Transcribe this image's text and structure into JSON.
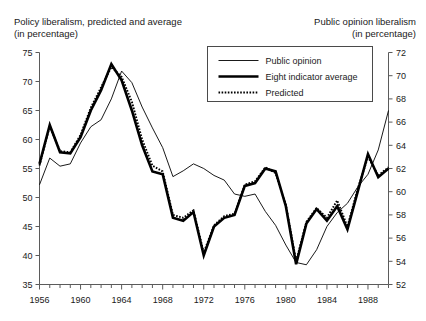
{
  "titles": {
    "left": "Policy liberalism, predicted and average\n(in percentage)",
    "right": "Public opinion liberalism\n(in percentage)"
  },
  "legend": {
    "items": [
      {
        "label": "Public opinion",
        "style": "thin-solid"
      },
      {
        "label": "Eight indicator average",
        "style": "thick-solid"
      },
      {
        "label": "Predicted",
        "style": "dotted"
      }
    ]
  },
  "chart_data": {
    "type": "line",
    "title": "",
    "xlabel": "",
    "ylabel": "Policy liberalism, predicted and average (in percentage)",
    "y2label": "Public opinion liberalism (in percentage)",
    "xlim": [
      1956,
      1990
    ],
    "ylim": [
      35,
      75
    ],
    "y2lim": [
      52,
      72
    ],
    "grid": false,
    "legend_position": "top-center",
    "x_tick_labels": [
      "1956",
      "1960",
      "1964",
      "1968",
      "1972",
      "1976",
      "1980",
      "1984",
      "1988"
    ],
    "x_tick_values": [
      1956,
      1960,
      1964,
      1968,
      1972,
      1976,
      1980,
      1984,
      1988
    ],
    "x_minor_tick_interval": 1,
    "y_tick_labels": [
      "35",
      "40",
      "45",
      "50",
      "55",
      "60",
      "65",
      "70",
      "75"
    ],
    "y_tick_values": [
      35,
      40,
      45,
      50,
      55,
      60,
      65,
      70,
      75
    ],
    "y2_tick_labels": [
      "52",
      "54",
      "56",
      "58",
      "60",
      "62",
      "64",
      "66",
      "68",
      "70",
      "72"
    ],
    "y2_tick_values": [
      52,
      54,
      56,
      58,
      60,
      62,
      64,
      66,
      68,
      70,
      72
    ],
    "x": [
      1956,
      1957,
      1958,
      1959,
      1960,
      1961,
      1962,
      1963,
      1964,
      1965,
      1966,
      1967,
      1968,
      1969,
      1970,
      1971,
      1972,
      1973,
      1974,
      1975,
      1976,
      1977,
      1978,
      1979,
      1980,
      1981,
      1982,
      1983,
      1984,
      1985,
      1986,
      1987,
      1988,
      1989,
      1990
    ],
    "series": [
      {
        "name": "Public opinion",
        "axis": "right",
        "unit": "percent",
        "values": [
          60.6,
          62.9,
          62.2,
          62.4,
          64.2,
          65.6,
          66.2,
          68.0,
          70.4,
          69.4,
          67.3,
          65.5,
          63.8,
          61.3,
          61.8,
          62.4,
          62.0,
          61.4,
          61.0,
          59.8,
          59.6,
          59.8,
          58.3,
          57.1,
          55.4,
          53.9,
          53.7,
          55.0,
          57.0,
          58.2,
          59.0,
          60.4,
          61.5,
          63.6,
          67.0
        ]
      },
      {
        "name": "Eight indicator average",
        "axis": "left",
        "unit": "percent",
        "values": [
          55.8,
          62.5,
          57.8,
          57.6,
          60.4,
          65.0,
          68.5,
          73.0,
          70.2,
          65.0,
          59.0,
          54.5,
          54.0,
          46.5,
          46.0,
          47.5,
          40.0,
          45.0,
          46.5,
          47.0,
          52.0,
          52.5,
          55.0,
          54.5,
          48.5,
          38.5,
          45.5,
          48.0,
          46.0,
          48.5,
          44.5,
          51.0,
          57.5,
          53.5,
          55.0
        ]
      },
      {
        "name": "Predicted",
        "axis": "left",
        "unit": "percent",
        "values": [
          55.5,
          62.3,
          58.0,
          57.8,
          60.8,
          65.5,
          69.0,
          72.5,
          70.8,
          66.5,
          60.0,
          55.5,
          54.5,
          47.0,
          46.5,
          47.8,
          40.5,
          45.2,
          46.8,
          47.2,
          52.2,
          52.8,
          55.2,
          54.2,
          48.8,
          39.0,
          45.8,
          48.2,
          46.5,
          49.5,
          45.0,
          51.5,
          57.0,
          53.8,
          55.2
        ]
      }
    ]
  }
}
